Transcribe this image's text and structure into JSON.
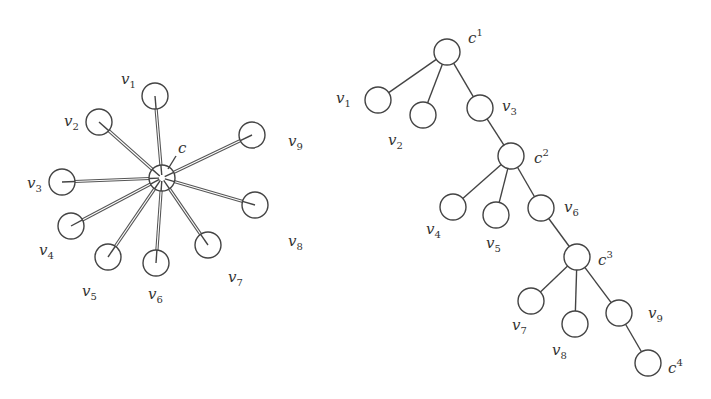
{
  "star_graph": {
    "center": {
      "label": "c",
      "x": 162,
      "y": 178,
      "label_x": 178,
      "label_y": 153
    },
    "radius": 13,
    "leaves": [
      {
        "id": "v1",
        "base": "v",
        "sub": "1",
        "x": 155,
        "y": 96,
        "lx": 121,
        "ly": 84
      },
      {
        "id": "v2",
        "base": "v",
        "sub": "2",
        "x": 99,
        "y": 122,
        "lx": 64,
        "ly": 126
      },
      {
        "id": "v3",
        "base": "v",
        "sub": "3",
        "x": 62,
        "y": 182,
        "lx": 27,
        "ly": 188
      },
      {
        "id": "v4",
        "base": "v",
        "sub": "4",
        "x": 71,
        "y": 226,
        "lx": 39,
        "ly": 255
      },
      {
        "id": "v5",
        "base": "v",
        "sub": "5",
        "x": 108,
        "y": 257,
        "lx": 82,
        "ly": 296
      },
      {
        "id": "v6",
        "base": "v",
        "sub": "6",
        "x": 156,
        "y": 263,
        "lx": 148,
        "ly": 299
      },
      {
        "id": "v7",
        "base": "v",
        "sub": "7",
        "x": 208,
        "y": 245,
        "lx": 228,
        "ly": 282
      },
      {
        "id": "v8",
        "base": "v",
        "sub": "8",
        "x": 255,
        "y": 205,
        "lx": 288,
        "ly": 246
      },
      {
        "id": "v9",
        "base": "v",
        "sub": "9",
        "x": 252,
        "y": 135,
        "lx": 288,
        "ly": 146
      }
    ]
  },
  "tree_graph": {
    "radius": 13,
    "nodes": [
      {
        "id": "c1",
        "base": "c",
        "sup": "1",
        "x": 447,
        "y": 52,
        "lx": 468,
        "ly": 43,
        "type": "center"
      },
      {
        "id": "v1",
        "base": "v",
        "sub": "1",
        "x": 378,
        "y": 100,
        "lx": 336,
        "ly": 103,
        "type": "leaf"
      },
      {
        "id": "v2",
        "base": "v",
        "sub": "2",
        "x": 423,
        "y": 115,
        "lx": 388,
        "ly": 145,
        "type": "leaf"
      },
      {
        "id": "v3",
        "base": "v",
        "sub": "3",
        "x": 480,
        "y": 108,
        "lx": 502,
        "ly": 111,
        "type": "leaf"
      },
      {
        "id": "c2",
        "base": "c",
        "sup": "2",
        "x": 511,
        "y": 156,
        "lx": 534,
        "ly": 163,
        "type": "center"
      },
      {
        "id": "v4",
        "base": "v",
        "sub": "4",
        "x": 453,
        "y": 207,
        "lx": 426,
        "ly": 234,
        "type": "leaf"
      },
      {
        "id": "v5",
        "base": "v",
        "sub": "5",
        "x": 496,
        "y": 215,
        "lx": 486,
        "ly": 248,
        "type": "leaf"
      },
      {
        "id": "v6",
        "base": "v",
        "sub": "6",
        "x": 541,
        "y": 208,
        "lx": 564,
        "ly": 212,
        "type": "leaf"
      },
      {
        "id": "c3",
        "base": "c",
        "sup": "3",
        "x": 577,
        "y": 257,
        "lx": 598,
        "ly": 265,
        "type": "center"
      },
      {
        "id": "v7",
        "base": "v",
        "sub": "7",
        "x": 531,
        "y": 301,
        "lx": 512,
        "ly": 330,
        "type": "leaf"
      },
      {
        "id": "v8",
        "base": "v",
        "sub": "8",
        "x": 575,
        "y": 324,
        "lx": 552,
        "ly": 355,
        "type": "leaf"
      },
      {
        "id": "v9",
        "base": "v",
        "sub": "9",
        "x": 619,
        "y": 313,
        "lx": 648,
        "ly": 318,
        "type": "leaf"
      },
      {
        "id": "c4",
        "base": "c",
        "sup": "4",
        "x": 648,
        "y": 363,
        "lx": 668,
        "ly": 373,
        "type": "center"
      }
    ],
    "edges": [
      [
        "c1",
        "v1"
      ],
      [
        "c1",
        "v2"
      ],
      [
        "c1",
        "v3"
      ],
      [
        "v3",
        "c2"
      ],
      [
        "c2",
        "v4"
      ],
      [
        "c2",
        "v5"
      ],
      [
        "c2",
        "v6"
      ],
      [
        "v6",
        "c3"
      ],
      [
        "c3",
        "v7"
      ],
      [
        "c3",
        "v8"
      ],
      [
        "c3",
        "v9"
      ],
      [
        "v9",
        "c4"
      ]
    ]
  }
}
